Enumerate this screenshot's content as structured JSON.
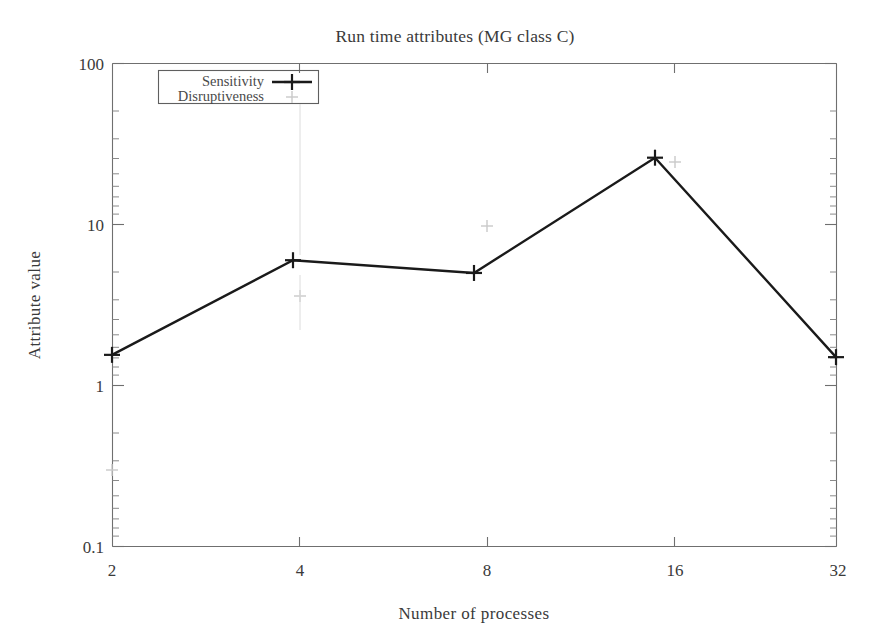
{
  "chart_data": {
    "type": "line",
    "title": "Run time attributes (MG class C)",
    "xlabel": "Number of processes",
    "ylabel": "Attribute value",
    "xscale": "log2",
    "yscale": "log10",
    "xlim": [
      2,
      32
    ],
    "ylim": [
      0.1,
      100
    ],
    "grid": false,
    "legend_position": "top-left-inside",
    "x": [
      2,
      4,
      8,
      16,
      32
    ],
    "xtick_labels": [
      "2",
      "4",
      "8",
      "16",
      "32"
    ],
    "ytick_labels": [
      "100",
      "10",
      "1",
      "0.1"
    ],
    "ytick_values": [
      100,
      10,
      1,
      0.1
    ],
    "series": [
      {
        "name": "Sensitivity",
        "marker": "plus",
        "line": "solid",
        "color": "#1a1a1a",
        "values": [
          1.55,
          6.0,
          5.0,
          26.0,
          1.5
        ]
      },
      {
        "name": "Disruptiveness",
        "marker": "plus",
        "line": "none",
        "color": "#c9c9c9",
        "values": [
          0.28,
          2.6,
          5.0,
          26.0,
          1.5
        ]
      }
    ],
    "annotations": []
  },
  "legend": {
    "entries": [
      {
        "label": "Sensitivity"
      },
      {
        "label": "Disruptiveness"
      }
    ]
  },
  "axes": {
    "y_minor_visible": true,
    "x_minor_visible": false
  }
}
